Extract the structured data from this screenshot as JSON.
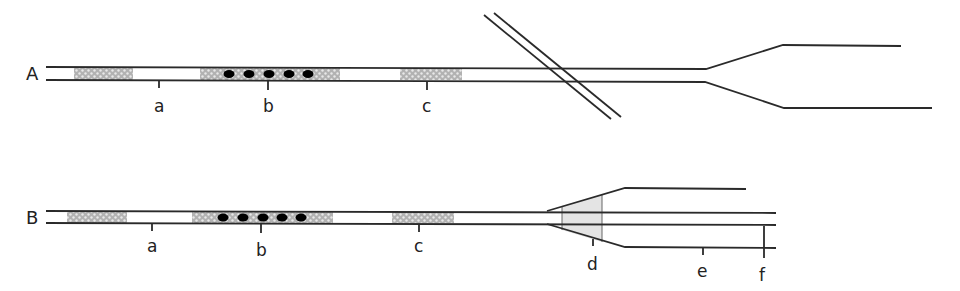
{
  "diagram": {
    "title": "",
    "panels": [
      {
        "id": "A",
        "label": "A",
        "markers": [
          {
            "label": "a"
          },
          {
            "label": "b"
          },
          {
            "label": "c"
          }
        ],
        "shaded_blocks": 3,
        "dots": 5,
        "features": [
          "crossing-track",
          "fork"
        ]
      },
      {
        "id": "B",
        "label": "B",
        "markers": [
          {
            "label": "a"
          },
          {
            "label": "b"
          },
          {
            "label": "c"
          },
          {
            "label": "d"
          },
          {
            "label": "e"
          },
          {
            "label": "f"
          }
        ],
        "shaded_blocks": 3,
        "dots": 5,
        "features": [
          "fork-with-shaded-transition",
          "parallel-branches"
        ]
      }
    ],
    "colors": {
      "line": "#2a2a2a",
      "shade": "#b5b5b5",
      "transition_fill": "#e4e4e4",
      "dot": "#000000"
    }
  }
}
